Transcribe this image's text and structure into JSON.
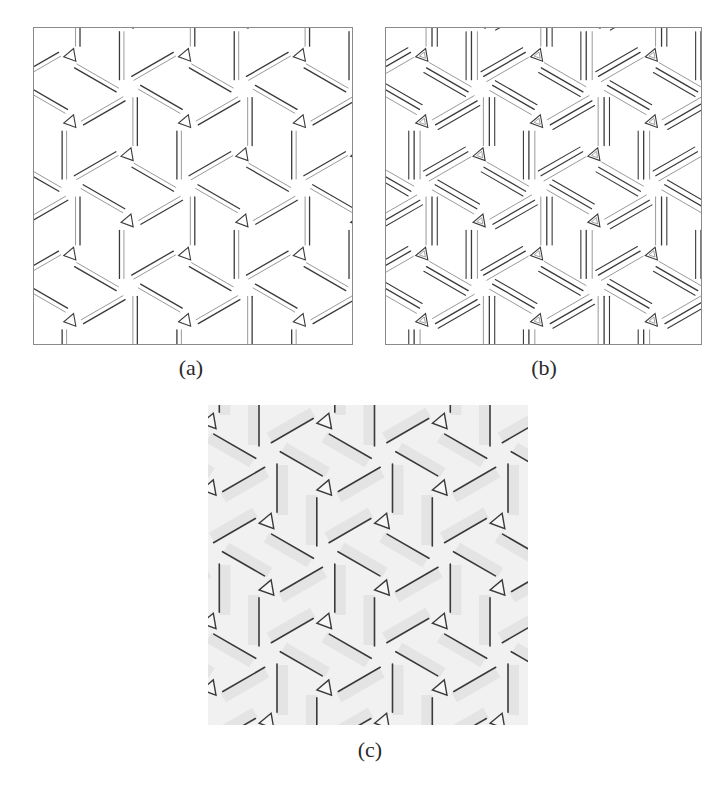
{
  "figure": {
    "panels": [
      {
        "id": "a",
        "caption": "(a)",
        "description": "Hexagonal twist-fold tessellation crease pattern, rendered with single pleat bands and small corner triangles",
        "style": "pleat-single",
        "frame": true
      },
      {
        "id": "b",
        "caption": "(b)",
        "description": "Same twist-fold tessellation with doubled pleat lines and nested triangles at pleat junctions",
        "style": "pleat-double",
        "frame": true
      },
      {
        "id": "c",
        "caption": "(c)",
        "description": "Folded paper rendering of the twist tessellation with soft grey shading",
        "style": "folded-shaded",
        "frame": false
      }
    ],
    "lattice": {
      "a": [
        115.5,
        0
      ],
      "b": [
        57.75,
        100
      ],
      "origin_a": [
        95,
        61
      ],
      "origin_b": [
        95,
        61
      ],
      "origin_c": [
        60,
        50
      ]
    },
    "colors": {
      "line": "#3a3a3a",
      "line_light": "#8c8c8c",
      "frame": "#8a8a8a",
      "paper": "#ffffff",
      "paper_c": "#f1f1f1",
      "shade_c": "#d9d9d9"
    }
  }
}
